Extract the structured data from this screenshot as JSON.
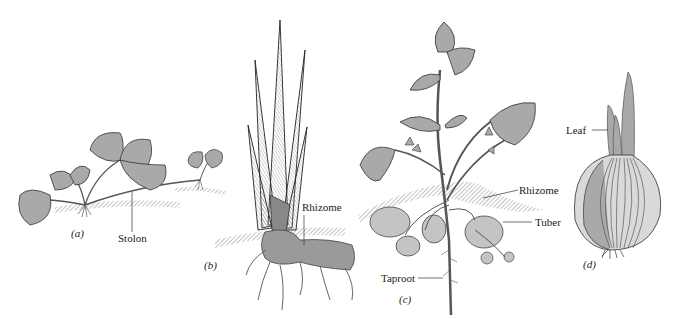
{
  "figure": {
    "panels": [
      {
        "id": "a",
        "label": "(a)",
        "callouts": [
          "Stolon"
        ]
      },
      {
        "id": "b",
        "label": "(b)",
        "callouts": [
          "Rhizome"
        ]
      },
      {
        "id": "c",
        "label": "(c)",
        "callouts": [
          "Rhizome",
          "Tuber",
          "Taproot"
        ]
      },
      {
        "id": "d",
        "label": "(d)",
        "callouts": [
          "Leaf"
        ]
      }
    ]
  },
  "colors": {
    "leaf_fill": "#a9a9a9",
    "rhizome_fill": "#9a9a9a",
    "tuber_fill": "#c4c4c4",
    "soil_hatch": "#8a8a8a",
    "outline": "#333333",
    "bulb_fill": "#d9d9d9"
  }
}
